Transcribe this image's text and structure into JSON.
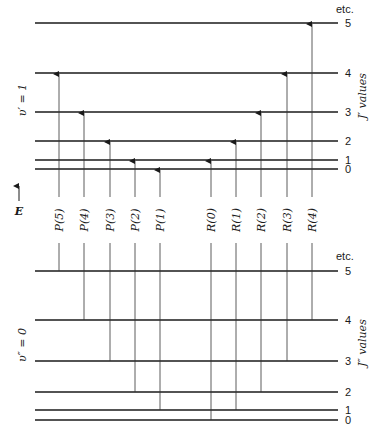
{
  "upper_state": {
    "label": "υ′ = 1",
    "axis_label": "J′ values",
    "etc_label": "etc.",
    "levels": [
      {
        "J": "0",
        "y": 169
      },
      {
        "J": "1",
        "y": 160
      },
      {
        "J": "2",
        "y": 141
      },
      {
        "J": "3",
        "y": 112
      },
      {
        "J": "4",
        "y": 73
      },
      {
        "J": "5",
        "y": 23
      }
    ]
  },
  "lower_state": {
    "label": "υ″ = 0",
    "axis_label": "J″ values",
    "etc_label": "etc.",
    "levels": [
      {
        "J": "0",
        "y": 420
      },
      {
        "J": "1",
        "y": 410
      },
      {
        "J": "2",
        "y": 392
      },
      {
        "J": "3",
        "y": 361
      },
      {
        "J": "4",
        "y": 320
      },
      {
        "J": "5",
        "y": 271
      }
    ]
  },
  "energy_axis": {
    "label": "E"
  },
  "transitions": [
    {
      "label": "P(5)",
      "branch": "P",
      "x": 59,
      "from_J": 5,
      "to_J": 4
    },
    {
      "label": "P(4)",
      "branch": "P",
      "x": 84,
      "from_J": 4,
      "to_J": 3
    },
    {
      "label": "P(3)",
      "branch": "P",
      "x": 110,
      "from_J": 3,
      "to_J": 2
    },
    {
      "label": "P(2)",
      "branch": "P",
      "x": 135,
      "from_J": 2,
      "to_J": 1
    },
    {
      "label": "P(1)",
      "branch": "P",
      "x": 160,
      "from_J": 1,
      "to_J": 0
    },
    {
      "label": "R(0)",
      "branch": "R",
      "x": 211,
      "from_J": 0,
      "to_J": 1
    },
    {
      "label": "R(1)",
      "branch": "R",
      "x": 236,
      "from_J": 1,
      "to_J": 2
    },
    {
      "label": "R(2)",
      "branch": "R",
      "x": 261,
      "from_J": 2,
      "to_J": 3
    },
    {
      "label": "R(3)",
      "branch": "R",
      "x": 287,
      "from_J": 3,
      "to_J": 4
    },
    {
      "label": "R(4)",
      "branch": "R",
      "x": 312,
      "from_J": 4,
      "to_J": 5
    }
  ],
  "layout": {
    "line_x_start": 35,
    "line_x_end": 338,
    "level_label_x": 345,
    "label_gap_top": 197,
    "label_gap_bottom": 243,
    "label_center_y": 220
  }
}
